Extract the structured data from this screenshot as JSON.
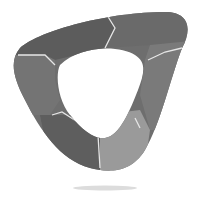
{
  "logo": {
    "shape": "rounded-triangle-ring",
    "segments": 6,
    "colors": {
      "dark": "#5a5a5a",
      "mid": "#787878",
      "light": "#a0a0a0",
      "seam": "#e6e6e6",
      "shadow": "#d8d8d8",
      "background": "#ffffff"
    }
  }
}
